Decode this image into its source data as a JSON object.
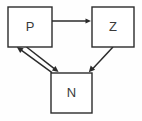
{
  "diagram": {
    "background_color": "#fefefe",
    "stroke_color": "#2b2b2b",
    "label_color": "#3a3a3a",
    "nodes": [
      {
        "id": "P",
        "label": "P",
        "x": 8,
        "y": 7,
        "width": 44,
        "height": 40,
        "center_x": 30,
        "center_y": 27
      },
      {
        "id": "Z",
        "label": "Z",
        "x": 92,
        "y": 7,
        "width": 42,
        "height": 40,
        "center_x": 113,
        "center_y": 27
      },
      {
        "id": "N",
        "label": "N",
        "x": 51,
        "y": 73,
        "width": 41,
        "height": 40,
        "center_x": 71,
        "center_y": 93
      }
    ],
    "edges": [
      {
        "id": "p-to-z",
        "from": "P",
        "to": "Z",
        "label": "",
        "x1": 52,
        "y1": 21,
        "x2": 91,
        "y2": 21,
        "arrowhead": "end"
      },
      {
        "id": "p-to-n",
        "from": "P",
        "to": "N",
        "label": "",
        "x1": 26,
        "y1": 47,
        "x2": 58,
        "y2": 72,
        "arrowhead": "end"
      },
      {
        "id": "n-to-p",
        "from": "N",
        "to": "P",
        "label": "",
        "x1": 52,
        "y1": 73,
        "x2": 17,
        "y2": 47,
        "arrowhead": "end"
      },
      {
        "id": "z-to-n",
        "from": "Z",
        "to": "N",
        "label": "",
        "x1": 113,
        "y1": 47,
        "x2": 89,
        "y2": 72,
        "arrowhead": "end"
      }
    ]
  }
}
